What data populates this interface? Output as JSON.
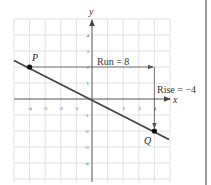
{
  "diagram": {
    "type": "coordinate-plane-slope",
    "axes": {
      "x_label": "x",
      "y_label": "y",
      "x_ticks": [
        "-4",
        "-3",
        "-2",
        "-1",
        "1",
        "2",
        "3",
        "4"
      ],
      "y_ticks": [
        "4",
        "3",
        "2",
        "1",
        "-1",
        "-2",
        "-3",
        "-4"
      ],
      "x_range": [
        -4,
        4
      ],
      "y_range": [
        -4,
        4
      ]
    },
    "points": {
      "P": {
        "label": "P",
        "x": -4,
        "y": 2
      },
      "Q": {
        "label": "Q",
        "x": 4,
        "y": -2
      }
    },
    "line": {
      "slope": -0.5,
      "intercept": 0,
      "color": "#444444"
    },
    "annotations": {
      "run_label": "Run = 8",
      "rise_label": "Rise = −4"
    },
    "colors": {
      "grid": "#e4e4e4",
      "axis": "#555555",
      "line": "#444444",
      "point": "#111111",
      "arrow": "#555555"
    }
  }
}
